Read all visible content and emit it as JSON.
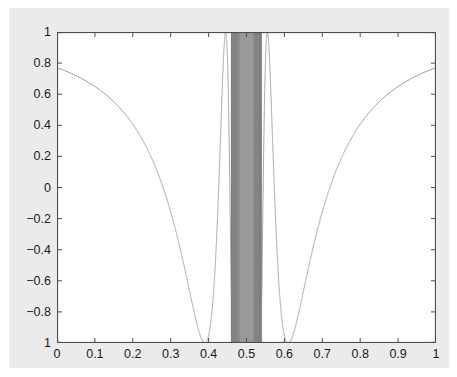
{
  "figure": {
    "background_color": "#ebebeb",
    "page_color": "#ffffff",
    "axes_background_color": "#ffffff",
    "axes_border_color": "#4d4d4d",
    "curve_color": "#8c8c8c",
    "dense_band_color": "#999999",
    "tick_color": "#4d4d4d",
    "label_color": "#1a1a1a"
  },
  "chart_data": {
    "type": "line",
    "title": "",
    "subtitle": "",
    "xlabel": "",
    "ylabel": "",
    "xlim": [
      0,
      1
    ],
    "ylim": [
      -1,
      1
    ],
    "grid": false,
    "legend": null,
    "legend_position": "none",
    "annotations": [],
    "xticks": [
      0,
      0.1,
      0.2,
      0.3,
      0.4,
      0.5,
      0.6,
      0.7,
      0.8,
      0.9,
      1
    ],
    "xtick_labels": [
      "0",
      "0.1",
      "0.2",
      "0.3",
      "0.4",
      "0.5",
      "0.6",
      "0.7",
      "0.8",
      "0.9",
      "1"
    ],
    "yticks": [
      1,
      0.8,
      0.6,
      0.4,
      0.2,
      0,
      -0.2,
      -0.4,
      -0.6,
      -0.8,
      -1
    ],
    "ytick_labels": [
      "1",
      "0.8",
      "0.6",
      "0.4",
      "0.2",
      "0",
      "−0.2",
      "−0.4",
      "−0.6",
      "−0.8",
      "1"
    ],
    "series": [
      {
        "name": "cos(1/(x-0.5))",
        "description": "Highly oscillatory function; oscillation frequency diverges as x approaches 0.5, producing a solid filled band near the singularity.",
        "color": "#8c8c8c",
        "line_width": 0.8,
        "singularity_x": 0.5,
        "envelope_min_x": [
          0.39,
          0.59
        ],
        "envelope_min_y": -1,
        "endpoints": [
          {
            "x": 0,
            "y": 1
          },
          {
            "x": 1,
            "y": 1
          }
        ],
        "sample_points": [
          {
            "x": 0.0,
            "y": 1.0
          },
          {
            "x": 0.05,
            "y": 0.95
          },
          {
            "x": 0.1,
            "y": 0.83
          },
          {
            "x": 0.15,
            "y": 0.64
          },
          {
            "x": 0.2,
            "y": 0.38
          },
          {
            "x": 0.25,
            "y": 0.07
          },
          {
            "x": 0.3,
            "y": -0.28
          },
          {
            "x": 0.35,
            "y": -0.68
          },
          {
            "x": 0.39,
            "y": -1.0
          },
          {
            "x": 0.42,
            "y": -0.83
          },
          {
            "x": 0.45,
            "y": 0.36
          },
          {
            "x": 0.47,
            "y": 1.0
          },
          {
            "x": 0.5,
            "y": 0.0
          },
          {
            "x": 0.53,
            "y": 1.0
          },
          {
            "x": 0.55,
            "y": 0.36
          },
          {
            "x": 0.58,
            "y": -0.83
          },
          {
            "x": 0.61,
            "y": -1.0
          },
          {
            "x": 0.65,
            "y": -0.68
          },
          {
            "x": 0.7,
            "y": -0.28
          },
          {
            "x": 0.75,
            "y": 0.07
          },
          {
            "x": 0.8,
            "y": 0.38
          },
          {
            "x": 0.85,
            "y": 0.64
          },
          {
            "x": 0.9,
            "y": 0.83
          },
          {
            "x": 0.95,
            "y": 0.95
          },
          {
            "x": 1.0,
            "y": 1.0
          }
        ],
        "dense_band": {
          "x_start": 0.46,
          "x_end": 0.54,
          "solid_core_start": 0.482,
          "solid_core_end": 0.518
        }
      }
    ]
  }
}
